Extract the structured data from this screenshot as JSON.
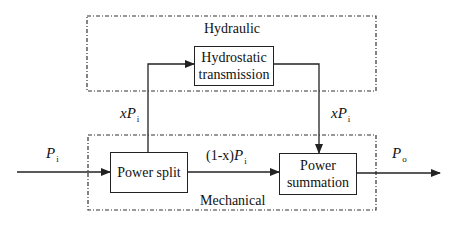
{
  "diagram": {
    "type": "block-diagram",
    "regions": {
      "hydraulic": {
        "label": "Hydraulic"
      },
      "mechanical": {
        "label": "Mechanical"
      }
    },
    "blocks": {
      "hydrostatic": {
        "line1": "Hydrostatic",
        "line2": "transmission"
      },
      "power_split": {
        "label": "Power split"
      },
      "power_summation": {
        "line1": "Power",
        "line2": "summation"
      }
    },
    "signals": {
      "input": {
        "symbol": "P",
        "sub": "i"
      },
      "output": {
        "symbol": "P",
        "sub": "o"
      },
      "hydraulic_branch_in": {
        "prefix": "x",
        "symbol": "P",
        "sub": "i"
      },
      "hydraulic_branch_out": {
        "prefix": "x",
        "symbol": "P",
        "sub": "i"
      },
      "mechanical_branch": {
        "prefix": "(1-x)",
        "symbol": "P",
        "sub": "i"
      }
    },
    "colors": {
      "stroke": "#222222",
      "background": "#ffffff"
    }
  }
}
